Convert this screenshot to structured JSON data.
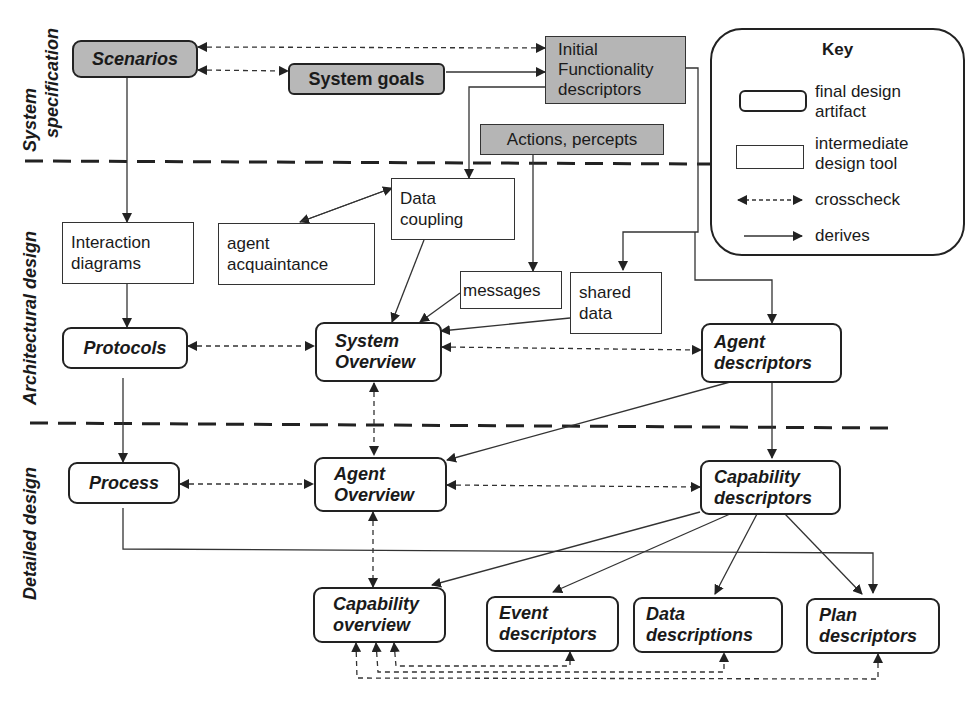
{
  "phases": {
    "system_spec": [
      "System",
      "specification"
    ],
    "architectural": "Architectural design",
    "detailed": "Detailed design"
  },
  "nodes": {
    "scenarios": "Scenarios",
    "system_goals": "System goals",
    "initial_functionality": [
      "Initial",
      "Functionality",
      "descriptors"
    ],
    "actions_percepts": "Actions, percepts",
    "interaction_diagrams": [
      "Interaction",
      "diagrams"
    ],
    "agent_acquaintance": [
      "agent",
      "acquaintance"
    ],
    "data_coupling": [
      "Data",
      "coupling"
    ],
    "messages": "messages",
    "shared_data": [
      "shared",
      "data"
    ],
    "protocols": "Protocols",
    "system_overview": [
      "System",
      "Overview"
    ],
    "agent_descriptors": [
      "Agent",
      "descriptors"
    ],
    "process": "Process",
    "agent_overview": [
      "Agent",
      "Overview"
    ],
    "capability_descriptors": [
      "Capability",
      "descriptors"
    ],
    "capability_overview": [
      "Capability",
      "overview"
    ],
    "event_descriptors": [
      "Event",
      "descriptors"
    ],
    "data_descriptions": [
      "Data",
      "descriptions"
    ],
    "plan_descriptors": [
      "Plan",
      "descriptors"
    ]
  },
  "key": {
    "title": "Key",
    "final_artifact": [
      "final design",
      "artifact"
    ],
    "intermediate_tool": [
      "intermediate",
      "design tool"
    ],
    "crosscheck": "crosscheck",
    "derives": "derives"
  }
}
